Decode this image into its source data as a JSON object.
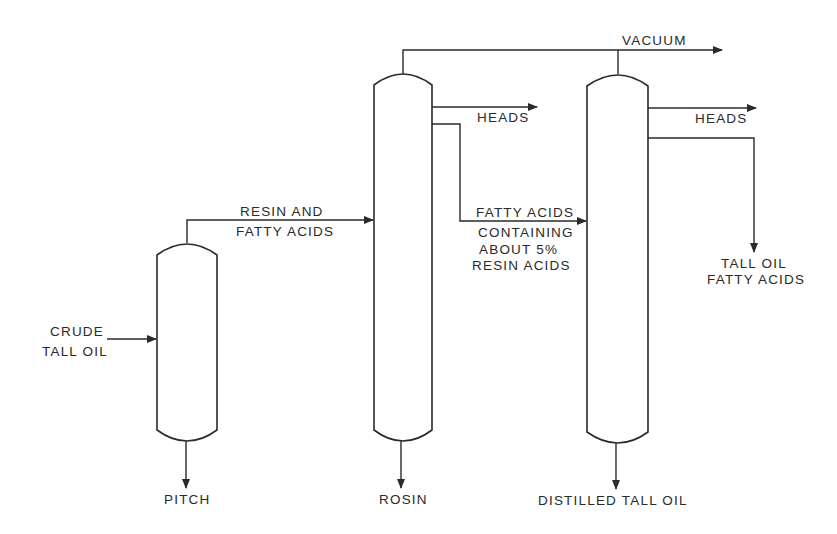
{
  "diagram": {
    "type": "process-flow",
    "colors": {
      "line": "#2a2a2a",
      "background": "#ffffff"
    },
    "vessels": [
      {
        "id": "column-1",
        "name": "pitch-column"
      },
      {
        "id": "column-2",
        "name": "rosin-column"
      },
      {
        "id": "column-3",
        "name": "distilled-tall-oil-column"
      }
    ],
    "labels": {
      "crude_line1": "CRUDE",
      "crude_line2": "TALL OIL",
      "resin_line1": "RESIN AND",
      "resin_line2": "FATTY ACIDS",
      "vacuum": "VACUUM",
      "heads_1": "HEADS",
      "heads_2": "HEADS",
      "fatty_line1": "FATTY ACIDS",
      "fatty_line2": "CONTAINING",
      "fatty_line3": "ABOUT 5%",
      "fatty_line4": "RESIN ACIDS",
      "tofa_line1": "TALL OIL",
      "tofa_line2": "FATTY ACIDS",
      "pitch": "PITCH",
      "rosin": "ROSIN",
      "distilled": "DISTILLED TALL OIL"
    },
    "streams": [
      {
        "from": "crude tall oil",
        "to": "column-1"
      },
      {
        "from": "column-1",
        "to": "column-2",
        "label": "RESIN AND FATTY ACIDS"
      },
      {
        "from": "column-1",
        "to": "pitch"
      },
      {
        "from": "column-2",
        "to": "vacuum"
      },
      {
        "from": "column-3",
        "to": "vacuum"
      },
      {
        "from": "column-2",
        "to": "heads"
      },
      {
        "from": "column-2",
        "to": "column-3",
        "label": "FATTY ACIDS CONTAINING ABOUT 5% RESIN ACIDS"
      },
      {
        "from": "column-2",
        "to": "rosin"
      },
      {
        "from": "column-3",
        "to": "heads"
      },
      {
        "from": "column-3",
        "to": "tall oil fatty acids"
      },
      {
        "from": "column-3",
        "to": "distilled tall oil"
      }
    ]
  }
}
